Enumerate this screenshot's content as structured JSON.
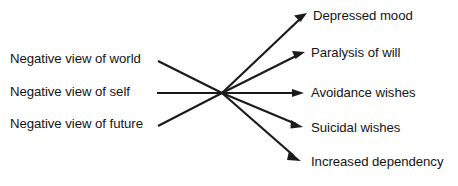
{
  "diagram": {
    "type": "fan-convergence-flow",
    "title": "",
    "stroke_color": "#1a1a1a",
    "background_color": "#ffffff",
    "hub": {
      "x": 222,
      "y": 93
    },
    "inputs": [
      {
        "label": "Negative view of world",
        "label_x": 10,
        "label_y": 52,
        "line_start_x": 158,
        "line_start_y": 61,
        "arrowhead": false
      },
      {
        "label": "Negative view of self",
        "label_x": 10,
        "label_y": 85,
        "line_start_x": 157,
        "line_start_y": 93,
        "arrowhead": false
      },
      {
        "label": "Negative view of future",
        "label_x": 10,
        "label_y": 117,
        "line_start_x": 158,
        "line_start_y": 126,
        "arrowhead": false
      }
    ],
    "outputs": [
      {
        "label": "Depressed mood",
        "label_x": 313,
        "label_y": 9,
        "arrow_tip_x": 307,
        "arrow_tip_y": 13,
        "arrowhead": true
      },
      {
        "label": "Paralysis of will",
        "label_x": 311,
        "label_y": 46,
        "arrow_tip_x": 305,
        "arrow_tip_y": 52,
        "arrowhead": true
      },
      {
        "label": "Avoidance wishes",
        "label_x": 311,
        "label_y": 86,
        "arrow_tip_x": 304,
        "arrow_tip_y": 93,
        "arrowhead": true
      },
      {
        "label": "Suicidal wishes",
        "label_x": 311,
        "label_y": 121,
        "arrow_tip_x": 303,
        "arrow_tip_y": 127,
        "arrowhead": true
      },
      {
        "label": "Increased dependency",
        "label_x": 311,
        "label_y": 155,
        "arrow_tip_x": 301,
        "arrow_tip_y": 161,
        "arrowhead": true
      }
    ]
  }
}
